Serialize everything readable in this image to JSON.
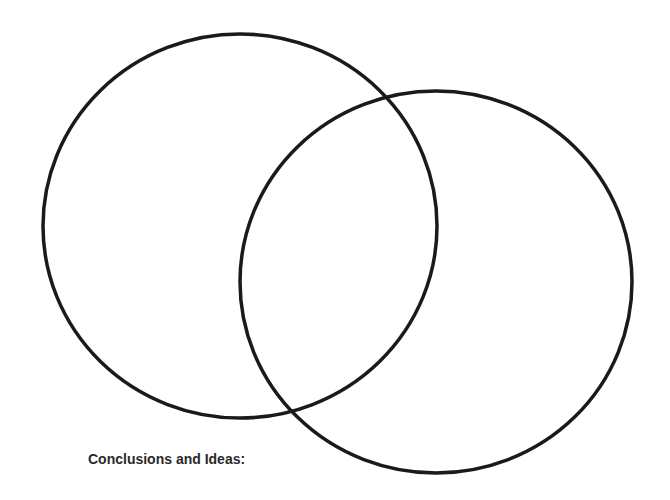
{
  "diagram": {
    "type": "venn",
    "circles": [
      {
        "name": "left",
        "cx": 240,
        "cy": 226,
        "rx": 197,
        "ry": 192
      },
      {
        "name": "right",
        "cx": 436,
        "cy": 282,
        "rx": 196,
        "ry": 191
      }
    ],
    "stroke_color": "#1a1a1a",
    "stroke_width": 3.5
  },
  "footer": {
    "label": "Conclusions and Ideas:"
  }
}
